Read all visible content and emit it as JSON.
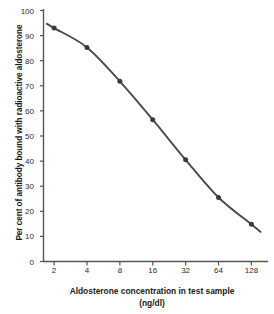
{
  "chart_data": {
    "type": "line",
    "title": "",
    "xlabel": "Aldosterone concentration in test sample",
    "xlabel_units": "(ng/dl)",
    "ylabel": "Per cent of antibody bound with radioactive aldosterone",
    "xscale": "log2",
    "x": [
      2,
      4,
      8,
      16,
      32,
      64,
      128
    ],
    "values": [
      93.0,
      85.3,
      71.8,
      56.5,
      40.5,
      25.5,
      14.8
    ],
    "xticks": [
      "2",
      "4",
      "8",
      "16",
      "32",
      "64",
      "128"
    ],
    "yticks": [
      "0",
      "10",
      "20",
      "30",
      "40",
      "50",
      "60",
      "70",
      "80",
      "90",
      "100"
    ],
    "ylim": [
      0,
      100
    ],
    "xlim": [
      1.6,
      160
    ],
    "grid": false,
    "legend": false,
    "marker": "filled-circle",
    "line_color": "#4a4a4a",
    "marker_color": "#3a3a3a",
    "axis_color": "#555555",
    "text_color": "#1a1a1a"
  }
}
